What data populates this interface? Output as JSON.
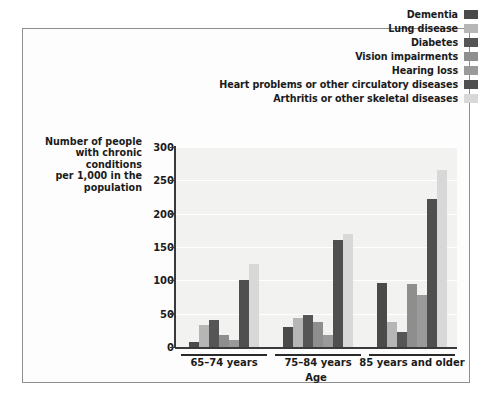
{
  "chart_data": {
    "type": "bar",
    "title": "",
    "subtitle": "",
    "xlabel": "Age",
    "ylabel": "Number of people with chronic conditions per 1,000 in the population",
    "ylabel_lines": [
      "Number of people",
      "with chronic conditions",
      "per 1,000 in the",
      "population"
    ],
    "categories": [
      "65–74 years",
      "75–84 years",
      "85 years and older"
    ],
    "ylim": [
      0,
      300
    ],
    "yticks": [
      0,
      50,
      100,
      150,
      200,
      250,
      300
    ],
    "ytick_labels": [
      "0",
      "50",
      "100",
      "150",
      "200",
      "250",
      "300"
    ],
    "grid": true,
    "legend_position": "top-right",
    "series": [
      {
        "name": "Dementia",
        "color": "#4a4a4a",
        "values": [
          8,
          30,
          96
        ]
      },
      {
        "name": "Lung disease",
        "color": "#b6b6b6",
        "values": [
          33,
          43,
          38
        ]
      },
      {
        "name": "Diabetes",
        "color": "#555555",
        "values": [
          40,
          48,
          22
        ]
      },
      {
        "name": "Vision impairments",
        "color": "#8e8e8e",
        "values": [
          18,
          38,
          95
        ]
      },
      {
        "name": "Hearing loss",
        "color": "#9a9a9a",
        "values": [
          10,
          18,
          78
        ]
      },
      {
        "name": "Heart problems or other circulatory diseases",
        "color": "#4f4f4f",
        "values": [
          100,
          160,
          222
        ]
      },
      {
        "name": "Arthritis or other skeletal diseases",
        "color": "#d8d8d8",
        "values": [
          125,
          170,
          265
        ]
      }
    ]
  },
  "figure": {
    "background_color": "#ffffff",
    "plot_background_color": "#f1f1ef",
    "frame_color": "#8e8e8e",
    "axis_color": "#3a3a3a",
    "grid_color": "#ffffff"
  }
}
